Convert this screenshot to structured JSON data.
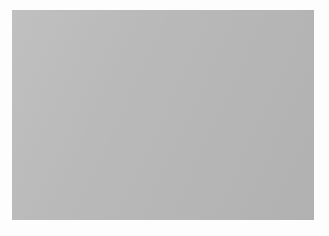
{
  "scene": {
    "title": "Collision Overlap Visualization",
    "background_color": "#b9b9b9",
    "frame_color": "#fdfdfd",
    "outline_color": "#4a4a4a",
    "thin_outline_color": "#6e6e6e",
    "fill_color": "#b3b3b3",
    "overlap_fill_color": "#b0b0b0",
    "arrow_color": "#5a5a5a",
    "marker_color": "#5f5f5f",
    "ground_line_color": "#a08a8a",
    "cursor_color": "#f2f2f2"
  },
  "shapes": [
    {
      "name": "left-polygon",
      "label": "small circle collider",
      "sides": 12,
      "center": [
        82,
        105
      ],
      "radius": 53,
      "fill": "#b4b4b4",
      "stroke": "#4e4e4e",
      "stroke_width": 1.4,
      "points": "82,52 109,59 128,78 135,105 128,132 109,151 82,158 55,151 36,132 29,105 36,78 55,59"
    },
    {
      "name": "right-polygon",
      "label": "large circle collider",
      "sides": 13,
      "center": [
        190,
        120
      ],
      "radius": 85,
      "fill": "#b4b4b4",
      "stroke": "#4e4e4e",
      "stroke_width": 1.6,
      "points": "178,35 217,40 249,58 271,88 276,124 266,157 243,184 210,199 175,198 145,181 123,153 113,119 123,83 146,53"
    },
    {
      "name": "overlap-lens",
      "label": "intersection region",
      "fill": "#b0b0b0",
      "stroke": "#707070",
      "stroke_width": 0.8,
      "points": "126,75 135,96 133,118 121,134 113,114 114,92"
    }
  ],
  "markers": [
    {
      "name": "contact-point-upper",
      "x": 127,
      "y": 75,
      "r": 4.2,
      "shape": "square-ish",
      "color": "#606060"
    },
    {
      "name": "contact-point-lower",
      "x": 119,
      "y": 134,
      "r": 4.4,
      "shape": "circle",
      "color": "#5d5d5d"
    }
  ],
  "arrow": {
    "name": "penetration-depth-arrow",
    "label": "separation / MTV vector",
    "from": [
      206,
      117
    ],
    "to": [
      113,
      101
    ],
    "color": "#595959",
    "width": 4.2,
    "head_length": 13,
    "head_width": 11,
    "direction": "left"
  },
  "cursor": {
    "name": "mouse-cursor",
    "x": 205,
    "y": 115,
    "color": "#f4f4f4",
    "outline": "#3c3c3c"
  },
  "ground_line": {
    "name": "horizon-line",
    "label": "ground / axis line",
    "from": [
      0,
      128
    ],
    "to": [
      302,
      170
    ],
    "color": "#a58d8d",
    "width": 0.8
  }
}
